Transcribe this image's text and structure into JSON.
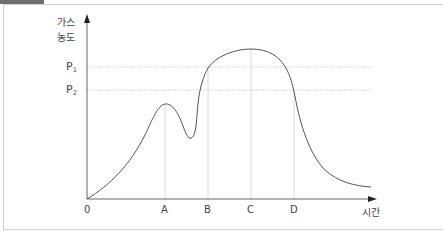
{
  "diagram": {
    "y_axis_label_line1": "가스",
    "y_axis_label_line2": "농도",
    "x_axis_label": "시간",
    "origin_label": "0",
    "levels": [
      {
        "main": "P",
        "sub": "1"
      },
      {
        "main": "P",
        "sub": "2"
      }
    ],
    "time_marks": [
      "A",
      "B",
      "C",
      "D"
    ],
    "colors": {
      "curve": "#555555",
      "axis": "#333333",
      "guide": "#bbbbbb",
      "frame": "#cfcfcf",
      "tab": "#6e6e6e"
    }
  }
}
